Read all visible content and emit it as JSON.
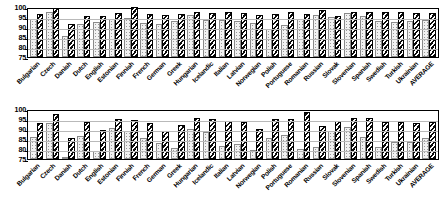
{
  "chart_data": [
    {
      "type": "bar",
      "title": "",
      "xlabel": "",
      "ylabel": "",
      "ylim": [
        75,
        100
      ],
      "yticks": [
        75,
        80,
        85,
        90,
        95,
        100
      ],
      "grid": true,
      "legend": "none",
      "categories": [
        "Bulgarian",
        "Czech",
        "Danish",
        "Dutch",
        "English",
        "Estonian",
        "Finnish",
        "French",
        "German",
        "Greek",
        "Hungarian",
        "Icelandic",
        "Italian",
        "Latvian",
        "Norwegian",
        "Polish",
        "Portuguese",
        "Romanian",
        "Russian",
        "Slovak",
        "Slovenian",
        "Spanish",
        "Swedish",
        "Turkish",
        "Ukrainian",
        "AVERAGE"
      ],
      "series": [
        {
          "name": "series-a",
          "values": [
            94.0,
            97.3,
            85.6,
            91.6,
            92.5,
            93.9,
            94.5,
            92.2,
            91.6,
            93.0,
            95.8,
            93.5,
            93.7,
            93.2,
            92.0,
            88.8,
            90.8,
            94.1,
            96.0,
            95.2,
            97.2,
            95.5,
            93.0,
            92.3,
            93.2,
            93.5
          ]
        },
        {
          "name": "series-b",
          "values": [
            96.7,
            99.5,
            91.3,
            95.5,
            95.6,
            97.0,
            100.0,
            96.3,
            96.2,
            96.7,
            97.3,
            97.0,
            97.3,
            97.2,
            96.1,
            96.5,
            97.7,
            96.5,
            98.5,
            95.7,
            97.4,
            97.3,
            97.6,
            97.5,
            96.8,
            96.9
          ]
        }
      ]
    },
    {
      "type": "bar",
      "title": "",
      "xlabel": "",
      "ylabel": "",
      "ylim": [
        75,
        100
      ],
      "yticks": [
        75,
        80,
        85,
        90,
        95,
        100
      ],
      "grid": true,
      "legend": "none",
      "categories": [
        "Bulgarian",
        "Czech",
        "Danish",
        "Dutch",
        "English",
        "Estonian",
        "Finnish",
        "French",
        "German",
        "Greek",
        "Hungarian",
        "Icelandic",
        "Italian",
        "Latvian",
        "Norwegian",
        "Polish",
        "Portuguese",
        "Romanian",
        "Russian",
        "Slovak",
        "Slovenian",
        "Spanish",
        "Swedish",
        "Turkish",
        "Ukrainian",
        "AVERAGE"
      ],
      "series": [
        {
          "name": "series-a",
          "values": [
            86.0,
            93.2,
            75.8,
            86.6,
            79.2,
            90.3,
            89.2,
            85.5,
            83.0,
            80.5,
            89.8,
            88.7,
            81.5,
            82.5,
            79.3,
            85.6,
            87.0,
            79.8,
            80.8,
            89.2,
            90.9,
            86.2,
            80.9,
            83.7,
            83.5,
            85.5
          ]
        },
        {
          "name": "series-b",
          "values": [
            93.2,
            97.3,
            85.5,
            93.5,
            89.3,
            95.2,
            94.5,
            93.2,
            88.8,
            91.8,
            95.5,
            95.0,
            93.8,
            93.3,
            90.0,
            95.2,
            95.2,
            98.5,
            91.6,
            93.8,
            95.6,
            95.5,
            93.5,
            93.5,
            92.8,
            93.5
          ]
        }
      ]
    }
  ]
}
